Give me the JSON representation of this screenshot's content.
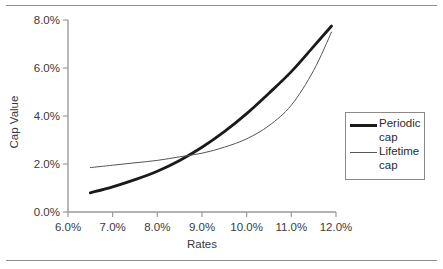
{
  "figure": {
    "has_top_rule": true,
    "has_bottom_rule": true,
    "rule_color": "#8e8e8e",
    "background": "#ffffff"
  },
  "axes": {
    "x_title": "Rates",
    "y_title": "Cap Value",
    "x_tick_labels": [
      "6.0%",
      "7.0%",
      "8.0%",
      "9.0%",
      "10.0%",
      "11.0%",
      "12.0%"
    ],
    "y_tick_labels": [
      "0.0%",
      "2.0%",
      "4.0%",
      "6.0%",
      "8.0%"
    ]
  },
  "legend": {
    "position": "right",
    "entries": [
      {
        "label": "Periodic\ncap",
        "label_line1": "Periodic",
        "label_line2": "cap",
        "style": "thick",
        "color": "#1a1a1a"
      },
      {
        "label": "Lifetime\ncap",
        "label_line1": "Lifetime",
        "label_line2": "cap",
        "style": "thin",
        "color": "#555555"
      }
    ]
  },
  "chart_data": {
    "type": "line",
    "title": "",
    "xlabel": "Rates",
    "ylabel": "Cap Value",
    "xlim": [
      6.0,
      12.0
    ],
    "ylim": [
      0.0,
      8.0
    ],
    "x_unit": "percent",
    "y_unit": "percent",
    "xticks": [
      6.0,
      7.0,
      8.0,
      9.0,
      10.0,
      11.0,
      12.0
    ],
    "yticks": [
      0.0,
      2.0,
      4.0,
      6.0,
      8.0
    ],
    "grid": false,
    "legend_position": "right",
    "x": [
      6.5,
      7.0,
      7.5,
      8.0,
      8.5,
      9.0,
      9.5,
      10.0,
      10.5,
      11.0,
      11.5,
      11.9
    ],
    "series": [
      {
        "name": "Periodic cap",
        "line_width": "thick",
        "color": "#1a1a1a",
        "values": [
          0.8,
          1.05,
          1.35,
          1.7,
          2.15,
          2.7,
          3.35,
          4.1,
          4.95,
          5.85,
          6.9,
          7.75
        ]
      },
      {
        "name": "Lifetime cap",
        "line_width": "thin",
        "color": "#555555",
        "values": [
          1.85,
          1.95,
          2.05,
          2.15,
          2.3,
          2.45,
          2.7,
          3.05,
          3.6,
          4.45,
          5.9,
          7.5
        ]
      }
    ],
    "annotations": [
      {
        "text": "curves cross",
        "x": 8.6,
        "y": 2.4
      }
    ]
  }
}
